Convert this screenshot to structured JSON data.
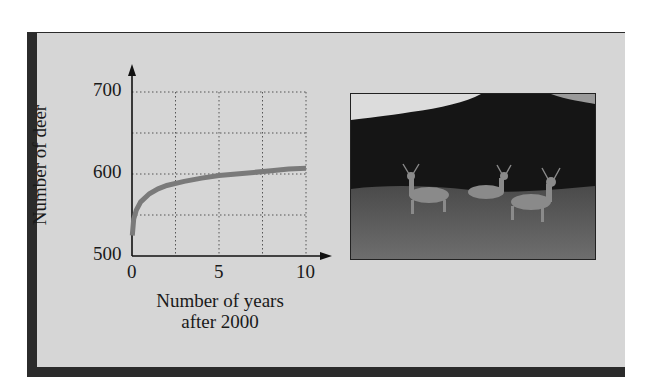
{
  "chart_data": {
    "type": "line",
    "title": "",
    "xlabel": "Number of years after 2000",
    "ylabel": "Number of deer",
    "xlim": [
      0,
      10
    ],
    "ylim": [
      500,
      700
    ],
    "x_ticks": [
      "0",
      "5",
      "10"
    ],
    "y_ticks": [
      "500",
      "600",
      "700"
    ],
    "grid": true,
    "grid_style": "dotted",
    "x_grid_step": 2.5,
    "y_grid_step": 25,
    "legend": null,
    "series": [
      {
        "name": "deer population",
        "color": "#7a7a7a",
        "x": [
          0.02,
          0.1,
          0.25,
          0.5,
          1,
          1.5,
          2,
          3,
          4,
          5,
          6,
          7,
          8,
          9,
          10
        ],
        "y": [
          525,
          545,
          556,
          566,
          576,
          582,
          586,
          591,
          595,
          598,
          600,
          602,
          604,
          606,
          607
        ]
      }
    ]
  },
  "labels": {
    "ylabel": "Number of deer",
    "xlabel_line1": "Number of years",
    "xlabel_line2": "after 2000",
    "y700": "700",
    "y600": "600",
    "y500": "500",
    "x0": "0",
    "x5": "5",
    "x10": "10"
  },
  "photo": {
    "subject": "deer-in-meadow-photo"
  },
  "colors": {
    "panel": "#d6d6d6",
    "frame": "#2b2b2b",
    "curve": "#7a7a7a",
    "axis": "#111111"
  }
}
